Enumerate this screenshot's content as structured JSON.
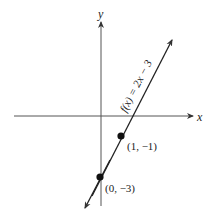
{
  "axes": {
    "x_label": "x",
    "y_label": "y"
  },
  "function": {
    "label": "f(x) = 2x − 3",
    "slope": 2,
    "intercept": -3
  },
  "points": [
    {
      "label": "(1, −1)",
      "x": 1,
      "y": -1
    },
    {
      "label": "(0, −3)",
      "x": 0,
      "y": -3
    }
  ],
  "colors": {
    "line": "#222222",
    "axis": "#555555"
  }
}
